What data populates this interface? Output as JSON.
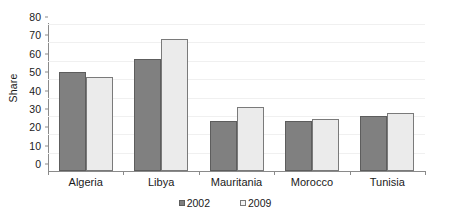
{
  "chart_data": {
    "type": "bar",
    "title": "",
    "subtitle": "",
    "xlabel": "",
    "ylabel": "Share",
    "ylim": [
      0,
      80
    ],
    "ytick_step": 10,
    "yticks": [
      0,
      10,
      20,
      30,
      40,
      50,
      60,
      70,
      80
    ],
    "grid": true,
    "grid_axis": "y",
    "legend_position": "bottom-center",
    "categories": [
      "Algeria",
      "Libya",
      "Mauritania",
      "Morocco",
      "Tunisia"
    ],
    "series": [
      {
        "name": "2002",
        "color": "#808080",
        "values": [
          54,
          61,
          27,
          27,
          30
        ]
      },
      {
        "name": "2009",
        "color": "#ebebeb",
        "values": [
          51,
          72,
          35,
          28.5,
          31.5
        ]
      }
    ]
  },
  "colors": {
    "series_2002": "#808080",
    "series_2009": "#ebebeb",
    "axis": "#8a8a8a",
    "gridline": "#f0f0f0",
    "text": "#1a1a1a",
    "background": "#ffffff"
  }
}
